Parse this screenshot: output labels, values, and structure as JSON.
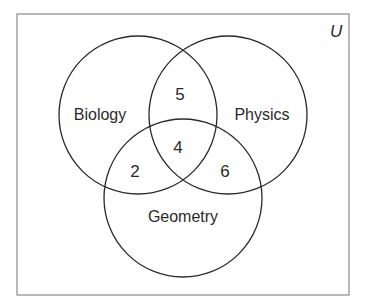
{
  "diagram": {
    "type": "venn",
    "universe_label": "U",
    "sets": [
      {
        "name": "Biology"
      },
      {
        "name": "Physics"
      },
      {
        "name": "Geometry"
      }
    ],
    "regions": {
      "biology_physics_only": "5",
      "all_three": "4",
      "biology_geometry_only": "2",
      "physics_geometry_only": "6"
    }
  }
}
